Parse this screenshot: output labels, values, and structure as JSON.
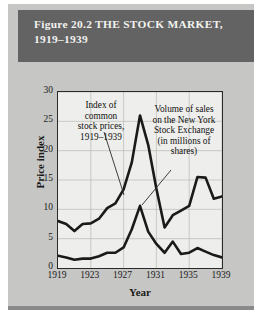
{
  "figure": {
    "title_line1": "Figure 20.2  THE STOCK MARKET,",
    "title_line2": "1919–1939",
    "banner_color": "#636363",
    "banner_text_color": "#f2f2ef",
    "panel_color": "#c6c6c4",
    "plot_background": "#eeeeec"
  },
  "annotations": {
    "left": {
      "line1": "Index of",
      "line2": "common",
      "line3": "stock prices,",
      "line4": "1919–1939"
    },
    "right": {
      "line1": "Volume of sales",
      "line2": "on the New York",
      "line3": "Stock Exchange",
      "line4": "(in millions of",
      "line5": "shares)"
    }
  },
  "chart_data": {
    "type": "line",
    "title": "Figure 20.2  THE STOCK MARKET, 1919–1939",
    "xlabel": "Year",
    "ylabel": "Price index",
    "xlim": [
      1919,
      1939
    ],
    "ylim": [
      0,
      30
    ],
    "yticks": [
      0,
      5,
      10,
      15,
      20,
      25,
      30
    ],
    "xticks": [
      1919,
      1923,
      1927,
      1931,
      1935,
      1939
    ],
    "grid": true,
    "legend": "annotations",
    "line_color": "#1a1a1a",
    "x": [
      1919,
      1920,
      1921,
      1922,
      1923,
      1924,
      1925,
      1926,
      1927,
      1928,
      1929,
      1930,
      1931,
      1932,
      1933,
      1934,
      1935,
      1936,
      1937,
      1938,
      1939
    ],
    "series": [
      {
        "name": "Index of common stock prices, 1919–1939",
        "values": [
          8.0,
          7.5,
          6.3,
          7.5,
          7.6,
          8.4,
          10.2,
          11.0,
          13.4,
          18.0,
          26.0,
          21.0,
          13.5,
          6.9,
          9.0,
          9.8,
          10.6,
          15.5,
          15.4,
          11.8,
          12.2
        ]
      },
      {
        "name": "Volume of sales on the New York Stock Exchange (in millions of shares)",
        "values": [
          2.1,
          1.8,
          1.4,
          1.6,
          1.6,
          2.0,
          2.6,
          2.6,
          3.5,
          6.6,
          10.6,
          6.2,
          4.1,
          2.6,
          4.5,
          2.4,
          2.6,
          3.4,
          2.8,
          2.2,
          1.8
        ]
      }
    ]
  }
}
